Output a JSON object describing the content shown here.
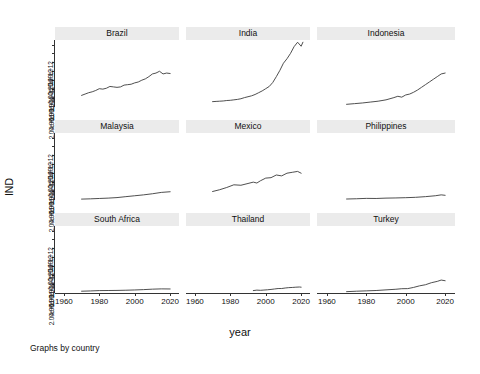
{
  "figure": {
    "ylabel": "IND",
    "xlabel": "year",
    "note": "Graphs by country"
  },
  "chart_data": {
    "type": "line",
    "title": "",
    "subtitle": "",
    "xlabel": "year",
    "ylabel": "IND",
    "note": "Graphs by country",
    "layout": "small-multiples 3x3, shared x axis, per-row y axis",
    "grid": false,
    "legend": "none",
    "xlim": [
      1955,
      2025
    ],
    "xticks": [
      1960,
      1980,
      2000,
      2020
    ],
    "xtick_labels": [
      "1960",
      "1980",
      "2000",
      "2020"
    ],
    "yticks": [
      200000000000.0,
      400000000000.0,
      600000000000.0,
      800000000000.0,
      1000000000000.0,
      1200000000000.0,
      1400000000000.0
    ],
    "ytick_labels": [
      "2.00e+11",
      "4.00e+11",
      "6.00e+11",
      "8.00e+11",
      "1.00e+12",
      "1.20e+12",
      "1.40e+12"
    ],
    "ylim": [
      0,
      1500000000000.0
    ],
    "panels": [
      {
        "name": "Brazil",
        "row": 0,
        "col": 0,
        "x": [
          1970,
          1972,
          1974,
          1976,
          1978,
          1980,
          1982,
          1984,
          1986,
          1988,
          1990,
          1992,
          1994,
          1996,
          1998,
          2000,
          2002,
          2004,
          2006,
          2008,
          2010,
          2012,
          2014,
          2016,
          2018,
          2020
        ],
        "y": [
          260000000000.0,
          290000000000.0,
          320000000000.0,
          340000000000.0,
          370000000000.0,
          410000000000.0,
          400000000000.0,
          420000000000.0,
          460000000000.0,
          450000000000.0,
          440000000000.0,
          450000000000.0,
          490000000000.0,
          500000000000.0,
          510000000000.0,
          540000000000.0,
          560000000000.0,
          600000000000.0,
          630000000000.0,
          680000000000.0,
          740000000000.0,
          760000000000.0,
          800000000000.0,
          740000000000.0,
          760000000000.0,
          750000000000.0
        ]
      },
      {
        "name": "India",
        "row": 0,
        "col": 1,
        "x": [
          1970,
          1972,
          1974,
          1976,
          1978,
          1980,
          1982,
          1984,
          1986,
          1988,
          1990,
          1992,
          1994,
          1996,
          1998,
          2000,
          2002,
          2004,
          2006,
          2008,
          2010,
          2012,
          2014,
          2016,
          2018,
          2020,
          2021
        ],
        "y": [
          120000000000.0,
          125000000000.0,
          130000000000.0,
          135000000000.0,
          145000000000.0,
          150000000000.0,
          160000000000.0,
          170000000000.0,
          185000000000.0,
          210000000000.0,
          230000000000.0,
          250000000000.0,
          280000000000.0,
          320000000000.0,
          360000000000.0,
          410000000000.0,
          460000000000.0,
          550000000000.0,
          680000000000.0,
          820000000000.0,
          980000000000.0,
          1080000000000.0,
          1200000000000.0,
          1350000000000.0,
          1450000000000.0,
          1360000000000.0,
          1450000000000.0
        ]
      },
      {
        "name": "Indonesia",
        "row": 0,
        "col": 2,
        "x": [
          1970,
          1974,
          1978,
          1982,
          1986,
          1990,
          1994,
          1996,
          1998,
          2000,
          2002,
          2004,
          2006,
          2008,
          2010,
          2012,
          2014,
          2016,
          2018,
          2020
        ],
        "y": [
          60000000000.0,
          75000000000.0,
          90000000000.0,
          110000000000.0,
          130000000000.0,
          160000000000.0,
          210000000000.0,
          240000000000.0,
          220000000000.0,
          270000000000.0,
          290000000000.0,
          330000000000.0,
          380000000000.0,
          440000000000.0,
          500000000000.0,
          560000000000.0,
          620000000000.0,
          680000000000.0,
          740000000000.0,
          760000000000.0
        ]
      },
      {
        "name": "Malaysia",
        "row": 1,
        "col": 0,
        "x": [
          1970,
          1975,
          1980,
          1985,
          1990,
          1995,
          2000,
          2005,
          2010,
          2015,
          2020
        ],
        "y": [
          20000000000.0,
          26000000000.0,
          34000000000.0,
          42000000000.0,
          54000000000.0,
          75000000000.0,
          95000000000.0,
          115000000000.0,
          140000000000.0,
          170000000000.0,
          185000000000.0
        ]
      },
      {
        "name": "Mexico",
        "row": 1,
        "col": 1,
        "x": [
          1970,
          1974,
          1978,
          1982,
          1986,
          1990,
          1993,
          1995,
          1997,
          2000,
          2003,
          2006,
          2009,
          2012,
          2015,
          2018,
          2020
        ],
        "y": [
          190000000000.0,
          230000000000.0,
          280000000000.0,
          340000000000.0,
          330000000000.0,
          370000000000.0,
          400000000000.0,
          380000000000.0,
          430000000000.0,
          490000000000.0,
          500000000000.0,
          560000000000.0,
          540000000000.0,
          600000000000.0,
          620000000000.0,
          640000000000.0,
          600000000000.0
        ]
      },
      {
        "name": "Philippines",
        "row": 1,
        "col": 2,
        "x": [
          1970,
          1975,
          1980,
          1985,
          1990,
          1995,
          2000,
          2005,
          2010,
          2015,
          2018,
          2020
        ],
        "y": [
          22000000000.0,
          28000000000.0,
          36000000000.0,
          34000000000.0,
          42000000000.0,
          46000000000.0,
          52000000000.0,
          60000000000.0,
          75000000000.0,
          95000000000.0,
          115000000000.0,
          105000000000.0
        ]
      },
      {
        "name": "South Africa",
        "row": 2,
        "col": 0,
        "x": [
          1970,
          1975,
          1980,
          1985,
          1990,
          1995,
          2000,
          2005,
          2010,
          2015,
          2020
        ],
        "y": [
          40000000000.0,
          46000000000.0,
          54000000000.0,
          56000000000.0,
          58000000000.0,
          62000000000.0,
          68000000000.0,
          76000000000.0,
          86000000000.0,
          92000000000.0,
          90000000000.0
        ]
      },
      {
        "name": "Thailand",
        "row": 2,
        "col": 1,
        "x": [
          1993,
          1995,
          1997,
          1999,
          2001,
          2003,
          2005,
          2007,
          2009,
          2011,
          2013,
          2015,
          2017,
          2019,
          2020
        ],
        "y": [
          54000000000.0,
          64000000000.0,
          60000000000.0,
          66000000000.0,
          72000000000.0,
          80000000000.0,
          90000000000.0,
          100000000000.0,
          100000000000.0,
          112000000000.0,
          120000000000.0,
          124000000000.0,
          130000000000.0,
          134000000000.0,
          130000000000.0
        ]
      },
      {
        "name": "Turkey",
        "row": 2,
        "col": 2,
        "x": [
          1970,
          1975,
          1980,
          1985,
          1990,
          1995,
          1998,
          2001,
          2004,
          2007,
          2010,
          2013,
          2016,
          2018,
          2020
        ],
        "y": [
          30000000000.0,
          40000000000.0,
          48000000000.0,
          56000000000.0,
          70000000000.0,
          84000000000.0,
          96000000000.0,
          98000000000.0,
          125000000000.0,
          160000000000.0,
          185000000000.0,
          230000000000.0,
          260000000000.0,
          290000000000.0,
          275000000000.0
        ]
      }
    ]
  }
}
